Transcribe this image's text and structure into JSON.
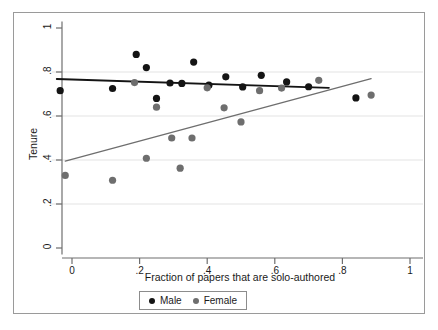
{
  "chart_data": {
    "type": "scatter",
    "title": "",
    "xlabel": "Fraction of papers that are solo-authored",
    "ylabel": "Tenure",
    "xlim": [
      -0.06,
      1.02
    ],
    "ylim": [
      -0.03,
      1.03
    ],
    "xticks": [
      0,
      0.2,
      0.4,
      0.6,
      0.8,
      1
    ],
    "xticklabels": [
      "0",
      ".2",
      ".4",
      ".6",
      ".8",
      "1"
    ],
    "yticks": [
      0,
      0.2,
      0.4,
      0.6,
      0.8,
      1
    ],
    "yticklabels": [
      "0",
      ".2",
      ".4",
      ".6",
      ".8",
      "1"
    ],
    "grid": "horizontal",
    "legend_position": "bottom-center",
    "series": [
      {
        "name": "Male",
        "color": "#141414",
        "marker": "circle",
        "points": [
          [
            -0.035,
            0.715
          ],
          [
            0.12,
            0.725
          ],
          [
            0.19,
            0.88
          ],
          [
            0.22,
            0.82
          ],
          [
            0.25,
            0.68
          ],
          [
            0.29,
            0.75
          ],
          [
            0.325,
            0.748
          ],
          [
            0.36,
            0.845
          ],
          [
            0.405,
            0.74
          ],
          [
            0.455,
            0.778
          ],
          [
            0.505,
            0.732
          ],
          [
            0.56,
            0.785
          ],
          [
            0.635,
            0.755
          ],
          [
            0.7,
            0.733
          ],
          [
            0.84,
            0.682
          ]
        ],
        "fit_line": {
          "x_start": -0.045,
          "y_start": 0.768,
          "x_end": 0.76,
          "y_end": 0.728
        }
      },
      {
        "name": "Female",
        "color": "#6e6e6e",
        "marker": "circle",
        "points": [
          [
            -0.02,
            0.33
          ],
          [
            0.12,
            0.308
          ],
          [
            0.185,
            0.752
          ],
          [
            0.22,
            0.408
          ],
          [
            0.25,
            0.64
          ],
          [
            0.295,
            0.5
          ],
          [
            0.32,
            0.363
          ],
          [
            0.355,
            0.5
          ],
          [
            0.4,
            0.728
          ],
          [
            0.45,
            0.637
          ],
          [
            0.5,
            0.573
          ],
          [
            0.555,
            0.715
          ],
          [
            0.62,
            0.727
          ],
          [
            0.73,
            0.762
          ],
          [
            0.885,
            0.695
          ]
        ],
        "fit_line": {
          "x_start": -0.02,
          "y_start": 0.395,
          "x_end": 0.885,
          "y_end": 0.77
        }
      }
    ]
  },
  "legend": {
    "items": [
      {
        "label": "Male",
        "color": "#141414"
      },
      {
        "label": "Female",
        "color": "#6e6e6e"
      }
    ]
  },
  "axes": {
    "x_title": "Fraction of papers that are solo-authored",
    "y_title": "Tenure",
    "x_tick_labels": [
      "0",
      ".2",
      ".4",
      ".6",
      ".8",
      "1"
    ],
    "y_tick_labels": [
      "0",
      ".2",
      ".4",
      ".6",
      ".8",
      "1"
    ]
  }
}
